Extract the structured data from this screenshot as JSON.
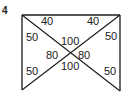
{
  "figure": {
    "problem_number": "4",
    "shape": "rectangle with both diagonals, open bottom edge",
    "line_color": "#1a1a1a",
    "labels": {
      "top_left_triangle": "40",
      "top_right_triangle": "40",
      "left_upper": "50",
      "right_upper": "50",
      "center_upper": "100",
      "center_left": "80",
      "center_right": "80",
      "center_lower": "100",
      "left_lower": "50",
      "right_lower": "50"
    }
  }
}
